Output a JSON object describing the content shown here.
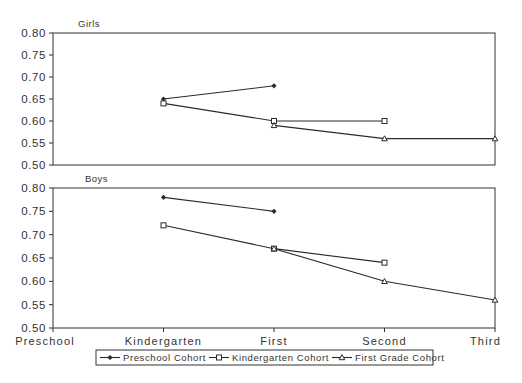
{
  "chart_data": [
    {
      "type": "line",
      "title": "Girls",
      "xlabel": "",
      "ylabel": "",
      "categories": [
        "Preschool",
        "Kindergarten",
        "First",
        "Second",
        "Third"
      ],
      "ylim": [
        0.5,
        0.8
      ],
      "yticks": [
        "0.80",
        "0.75",
        "0.70",
        "0.65",
        "0.60",
        "0.55",
        "0.50"
      ],
      "grid": false,
      "series": [
        {
          "name": "Preschool Cohort",
          "marker": "diamond",
          "values": [
            null,
            0.65,
            0.68,
            null,
            null
          ]
        },
        {
          "name": "Kindergarten Cohort",
          "marker": "square",
          "values": [
            null,
            0.64,
            0.6,
            0.6,
            null
          ]
        },
        {
          "name": "First Grade Cohort",
          "marker": "triangle",
          "values": [
            null,
            null,
            0.59,
            0.56,
            0.56
          ]
        }
      ]
    },
    {
      "type": "line",
      "title": "Boys",
      "xlabel": "",
      "ylabel": "",
      "categories": [
        "Preschool",
        "Kindergarten",
        "First",
        "Second",
        "Third"
      ],
      "ylim": [
        0.5,
        0.8
      ],
      "yticks": [
        "0.80",
        "0.75",
        "0.70",
        "0.65",
        "0.60",
        "0.55",
        "0.50"
      ],
      "grid": false,
      "series": [
        {
          "name": "Preschool Cohort",
          "marker": "diamond",
          "values": [
            null,
            0.78,
            0.75,
            null,
            null
          ]
        },
        {
          "name": "Kindergarten Cohort",
          "marker": "square",
          "values": [
            null,
            0.72,
            0.67,
            0.64,
            null
          ]
        },
        {
          "name": "First Grade Cohort",
          "marker": "triangle",
          "values": [
            null,
            null,
            0.67,
            0.6,
            0.56
          ]
        }
      ]
    }
  ],
  "legend": {
    "position": "bottom",
    "items": [
      "Preschool Cohort",
      "Kindergarten Cohort",
      "First Grade Cohort"
    ]
  },
  "colors": {
    "line": "#2a2a2a",
    "axis": "#333333",
    "background": "#ffffff"
  }
}
